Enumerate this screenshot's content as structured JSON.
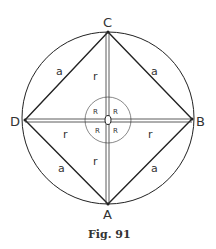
{
  "figure": {
    "caption": "Fig. 91",
    "vertices": {
      "A": "A",
      "B": "B",
      "C": "C",
      "D": "D"
    },
    "center_label": "O",
    "side_label": "a",
    "radius_label": "r",
    "angle_label": "R",
    "colors": {
      "stroke": "#222222",
      "background": "#ffffff"
    }
  }
}
